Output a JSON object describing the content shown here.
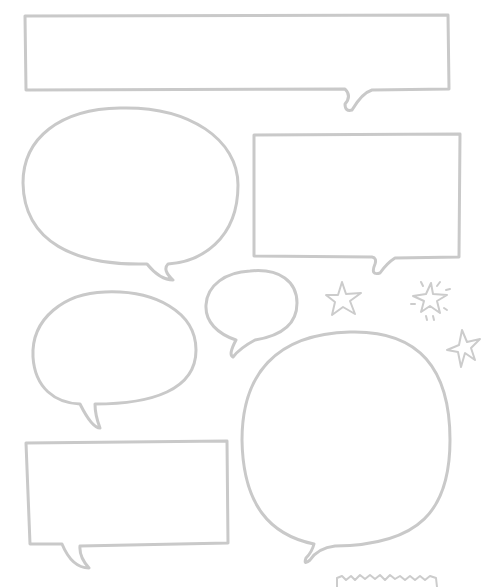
{
  "image": {
    "description": "Blank hand-drawn speech bubble clipart set",
    "background": "#ffffff",
    "stroke_color": "#c9c9c9"
  },
  "bubbles": [
    {
      "id": "wide-banner",
      "shape": "rectangle",
      "tail": "bottom-right"
    },
    {
      "id": "oval-large",
      "shape": "oval",
      "tail": "bottom-center"
    },
    {
      "id": "rect-right",
      "shape": "rectangle",
      "tail": "bottom-right"
    },
    {
      "id": "oval-small-left",
      "shape": "oval",
      "tail": "bottom-left"
    },
    {
      "id": "oval-tiny",
      "shape": "oval",
      "tail": "bottom-left"
    },
    {
      "id": "round-big",
      "shape": "rounded-square",
      "tail": "bottom-left"
    },
    {
      "id": "rect-bottom-left",
      "shape": "rectangle",
      "tail": "bottom-left"
    }
  ],
  "decorations": [
    {
      "id": "star-1",
      "type": "star"
    },
    {
      "id": "star-sparkle",
      "type": "star-with-sparkles"
    },
    {
      "id": "star-2",
      "type": "star"
    },
    {
      "id": "zigzag",
      "type": "zigzag-edge"
    }
  ]
}
